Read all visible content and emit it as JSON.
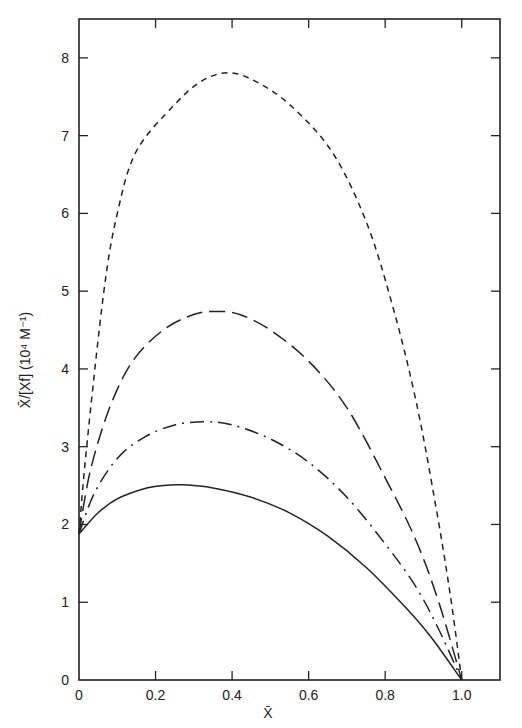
{
  "chart_data": {
    "type": "line",
    "title": "",
    "xlabel": "X̄",
    "ylabel": "X̄/[Xf]   (10⁴ M⁻¹)",
    "xlim": [
      0,
      1.1
    ],
    "ylim": [
      0,
      8.5
    ],
    "xticks": [
      0,
      0.2,
      0.4,
      0.6,
      0.8,
      1.0
    ],
    "xtick_labels": [
      "0",
      "0.2",
      "0.4",
      "0.6",
      "0.8",
      "1.0"
    ],
    "yticks": [
      0,
      1,
      2,
      3,
      4,
      5,
      6,
      7,
      8
    ],
    "ytick_labels": [
      "0",
      "1",
      "2",
      "3",
      "4",
      "5",
      "6",
      "7",
      "8"
    ],
    "grid": false,
    "legend": "none",
    "series": [
      {
        "name": "short-dashed curve",
        "style": "short-dash",
        "x": [
          0,
          0.02,
          0.065,
          0.1,
          0.15,
          0.25,
          0.32,
          0.39,
          0.46,
          0.55,
          0.66,
          0.75,
          0.82,
          0.88,
          0.93,
          0.97,
          1.0
        ],
        "y": [
          1.88,
          3.0,
          5.0,
          6.0,
          6.8,
          7.4,
          7.7,
          7.81,
          7.7,
          7.4,
          6.8,
          5.9,
          4.8,
          3.6,
          2.3,
          1.1,
          0.0
        ]
      },
      {
        "name": "long-dashed curve",
        "style": "long-dash",
        "x": [
          0,
          0.03,
          0.08,
          0.14,
          0.22,
          0.3,
          0.36,
          0.42,
          0.5,
          0.6,
          0.7,
          0.8,
          0.88,
          0.94,
          1.0
        ],
        "y": [
          1.88,
          2.7,
          3.5,
          4.1,
          4.5,
          4.7,
          4.74,
          4.7,
          4.5,
          4.1,
          3.5,
          2.6,
          1.8,
          1.0,
          0.0
        ]
      },
      {
        "name": "dash-dot curve",
        "style": "dash-dot",
        "x": [
          0,
          0.04,
          0.1,
          0.17,
          0.25,
          0.33,
          0.4,
          0.5,
          0.6,
          0.7,
          0.8,
          0.88,
          0.94,
          1.0
        ],
        "y": [
          1.88,
          2.4,
          2.85,
          3.12,
          3.28,
          3.32,
          3.28,
          3.1,
          2.8,
          2.35,
          1.75,
          1.2,
          0.65,
          0.0
        ]
      },
      {
        "name": "solid curve",
        "style": "solid",
        "x": [
          0,
          0.05,
          0.1,
          0.17,
          0.22,
          0.27,
          0.35,
          0.45,
          0.55,
          0.65,
          0.75,
          0.85,
          0.92,
          1.0
        ],
        "y": [
          1.88,
          2.15,
          2.33,
          2.46,
          2.5,
          2.51,
          2.47,
          2.35,
          2.15,
          1.85,
          1.45,
          0.95,
          0.55,
          0.0
        ]
      }
    ]
  }
}
